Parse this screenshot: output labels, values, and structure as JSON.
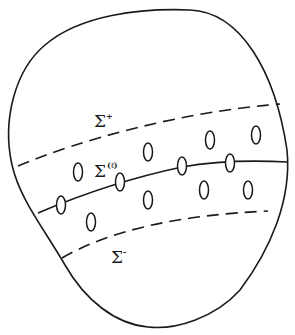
{
  "figure": {
    "labels": {
      "upper": {
        "base": "Σ",
        "sup": "+"
      },
      "middle": {
        "base": "Σ",
        "sup": "(ℓ)"
      },
      "lower": {
        "base": "Σ",
        "sup": "-"
      }
    },
    "colors": {
      "stroke": "#1a1a1a",
      "background": "#ffffff"
    },
    "holes": {
      "on_curve": [
        {
          "cx": 61,
          "cy": 205
        },
        {
          "cx": 120,
          "cy": 182
        },
        {
          "cx": 182,
          "cy": 166
        },
        {
          "cx": 230,
          "cy": 163
        }
      ],
      "off_curve": [
        {
          "cx": 78,
          "cy": 172
        },
        {
          "cx": 148,
          "cy": 152
        },
        {
          "cx": 210,
          "cy": 140
        },
        {
          "cx": 256,
          "cy": 135
        },
        {
          "cx": 91,
          "cy": 222
        },
        {
          "cx": 148,
          "cy": 200
        },
        {
          "cx": 204,
          "cy": 190
        },
        {
          "cx": 248,
          "cy": 190
        }
      ]
    }
  }
}
